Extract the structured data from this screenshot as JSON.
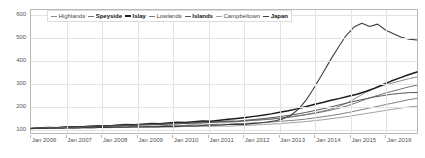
{
  "chart_data": {
    "type": "line",
    "title": "",
    "subtitle": "",
    "xlabel": "",
    "ylabel": "",
    "ylim": [
      80,
      620
    ],
    "yticks": [
      100,
      200,
      300,
      400,
      500,
      600
    ],
    "ytick_labels": [
      "100",
      "200",
      "300",
      "400",
      "500",
      "600"
    ],
    "xlim": [
      "Jan 2006",
      "Dec 2016"
    ],
    "xticks": [
      "Jan 2006",
      "Jan 2007",
      "Jan 2008",
      "Jan 2009",
      "Jan 2010",
      "Jan 2011",
      "Jan 2012",
      "Jan 2013",
      "Jan 2014",
      "Jan 2015",
      "Jan 2016"
    ],
    "grid": true,
    "legend_position": "top-center",
    "x_step_months": 3,
    "x_start": "Jan 2006",
    "series": [
      {
        "name": "Highlands",
        "color": "#8a8a8a",
        "width": 1.0,
        "emphasis": false,
        "values": [
          100,
          101,
          103,
          102,
          104,
          106,
          105,
          107,
          108,
          110,
          109,
          112,
          114,
          113,
          116,
          118,
          117,
          120,
          122,
          121,
          124,
          126,
          128,
          127,
          130,
          133,
          136,
          139,
          142,
          146,
          150,
          155,
          161,
          168,
          176,
          186,
          198,
          215,
          236,
          258,
          274,
          288,
          298,
          308,
          318,
          326
        ]
      },
      {
        "name": "Speyside",
        "color": "#6f6f6f",
        "width": 1.0,
        "emphasis": false,
        "values": [
          100,
          102,
          101,
          104,
          106,
          105,
          108,
          110,
          109,
          112,
          114,
          113,
          116,
          118,
          117,
          119,
          121,
          120,
          123,
          125,
          124,
          127,
          129,
          131,
          130,
          133,
          136,
          138,
          141,
          145,
          149,
          154,
          160,
          166,
          173,
          181,
          190,
          201,
          214,
          228,
          240,
          252,
          262,
          272,
          282,
          290
        ]
      },
      {
        "name": "Islay",
        "color": "#1c1c1c",
        "width": 1.5,
        "emphasis": true,
        "values": [
          100,
          102,
          104,
          103,
          106,
          108,
          107,
          110,
          112,
          111,
          114,
          117,
          116,
          119,
          122,
          121,
          124,
          127,
          126,
          130,
          133,
          132,
          136,
          140,
          144,
          148,
          153,
          158,
          164,
          171,
          178,
          186,
          195,
          205,
          214,
          224,
          232,
          241,
          250,
          262,
          276,
          292,
          308,
          322,
          336,
          348
        ]
      },
      {
        "name": "Lowlands",
        "color": "#7d7d7d",
        "width": 1.0,
        "emphasis": false,
        "values": [
          100,
          101,
          100,
          102,
          103,
          102,
          104,
          105,
          104,
          106,
          108,
          107,
          109,
          110,
          109,
          111,
          113,
          112,
          114,
          116,
          115,
          117,
          119,
          118,
          120,
          122,
          124,
          126,
          128,
          131,
          134,
          137,
          141,
          146,
          151,
          157,
          163,
          170,
          178,
          186,
          194,
          202,
          210,
          218,
          226,
          232
        ]
      },
      {
        "name": "Islands",
        "color": "#555555",
        "width": 1.0,
        "emphasis": false,
        "values": [
          100,
          102,
          103,
          102,
          105,
          107,
          106,
          109,
          111,
          110,
          113,
          115,
          114,
          117,
          119,
          118,
          121,
          123,
          122,
          125,
          128,
          127,
          130,
          133,
          132,
          136,
          139,
          143,
          147,
          152,
          157,
          163,
          170,
          178,
          186,
          195,
          204,
          213,
          222,
          230,
          238,
          244,
          250,
          254,
          257,
          258
        ]
      },
      {
        "name": "Campbeltown",
        "color": "#a0a0a0",
        "width": 1.0,
        "emphasis": false,
        "values": [
          100,
          99,
          101,
          100,
          102,
          101,
          103,
          102,
          104,
          103,
          105,
          104,
          106,
          105,
          107,
          106,
          108,
          107,
          109,
          108,
          110,
          109,
          111,
          110,
          112,
          113,
          115,
          117,
          119,
          121,
          124,
          127,
          130,
          134,
          138,
          143,
          148,
          153,
          159,
          165,
          171,
          177,
          183,
          189,
          194,
          198
        ]
      },
      {
        "name": "Japan",
        "color": "#3d3d3d",
        "width": 1.1,
        "emphasis": false,
        "values": [
          100,
          101,
          100,
          102,
          101,
          103,
          102,
          104,
          103,
          105,
          104,
          106,
          105,
          107,
          106,
          108,
          107,
          109,
          108,
          110,
          112,
          111,
          113,
          115,
          114,
          117,
          119,
          118,
          121,
          124,
          128,
          134,
          142,
          158,
          186,
          228,
          282,
          340,
          400,
          455,
          508,
          545,
          562,
          548,
          558,
          532,
          516,
          500,
          492,
          488
        ]
      }
    ]
  },
  "legend": {
    "items": [
      {
        "label": "Highlands",
        "dash_color": "#8a8a8a",
        "dash_weight": "1px",
        "bold": false
      },
      {
        "label": "Speyside",
        "dash_color": "#6f6f6f",
        "dash_weight": "1px",
        "bold": true
      },
      {
        "label": "Islay",
        "dash_color": "#1c1c1c",
        "dash_weight": "2px",
        "bold": true
      },
      {
        "label": "Lowlands",
        "dash_color": "#7d7d7d",
        "dash_weight": "1px",
        "bold": false
      },
      {
        "label": "Islands",
        "dash_color": "#555555",
        "dash_weight": "1px",
        "bold": true
      },
      {
        "label": "Campbeltown",
        "dash_color": "#a0a0a0",
        "dash_weight": "1px",
        "bold": false
      },
      {
        "label": "Japan",
        "dash_color": "#3d3d3d",
        "dash_weight": "1px",
        "bold": true
      }
    ]
  }
}
